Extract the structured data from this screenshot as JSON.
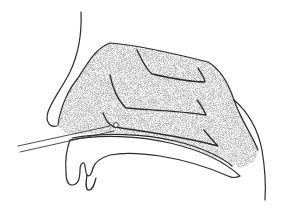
{
  "figure": {
    "style": "stippled line drawing",
    "colors": {
      "background": "#ffffff",
      "line": "#2a2a2a",
      "stipple": "#9a9a9a"
    },
    "elements": [
      "nose-profile",
      "nasal-cavity-stippled",
      "superior-turbinate-fold",
      "middle-turbinate-fold",
      "inferior-turbinate-fold",
      "hard-palate",
      "probe",
      "upper-lip",
      "posterior-pharynx-wall"
    ]
  }
}
